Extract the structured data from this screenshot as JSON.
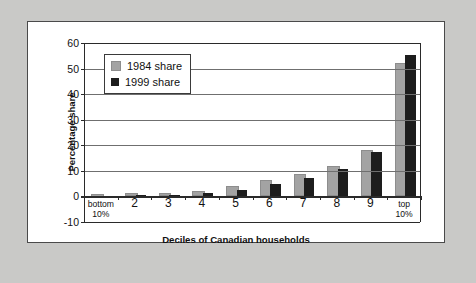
{
  "figure": {
    "background_color": "#c9c9c7",
    "panel_color": "#ffffff",
    "panel_border_color": "#4a4a4a"
  },
  "chart_data": {
    "type": "bar",
    "title": "",
    "subtitle": "",
    "xlabel": "Deciles of Canadian households",
    "ylabel": "Percentage share",
    "categories": [
      "bottom\n10%",
      "2",
      "3",
      "4",
      "5",
      "6",
      "7",
      "8",
      "9",
      "top\n10%"
    ],
    "category_labels": [
      {
        "line1": "bottom",
        "line2": "10%",
        "multiline": true
      },
      {
        "line1": "2",
        "line2": "",
        "multiline": false
      },
      {
        "line1": "3",
        "line2": "",
        "multiline": false
      },
      {
        "line1": "4",
        "line2": "",
        "multiline": false
      },
      {
        "line1": "5",
        "line2": "",
        "multiline": false
      },
      {
        "line1": "6",
        "line2": "",
        "multiline": false
      },
      {
        "line1": "7",
        "line2": "",
        "multiline": false
      },
      {
        "line1": "8",
        "line2": "",
        "multiline": false
      },
      {
        "line1": "9",
        "line2": "",
        "multiline": false
      },
      {
        "line1": "top",
        "line2": "10%",
        "multiline": true
      }
    ],
    "series": [
      {
        "name": "1984 share",
        "color": "#a3a3a3",
        "values": [
          -0.3,
          0.2,
          0.7,
          1.5,
          3.4,
          5.5,
          7.9,
          11.1,
          17.2,
          51.5
        ]
      },
      {
        "name": "1999 share",
        "color": "#1d1d1d",
        "values": [
          -0.4,
          0.1,
          0.3,
          1.2,
          2.7,
          4.7,
          7.3,
          10.7,
          17.3,
          55.5
        ]
      }
    ],
    "ylim": [
      -10,
      60
    ],
    "ytick_values": [
      -10,
      0,
      10,
      20,
      30,
      40,
      50,
      60
    ],
    "ytick_labels": [
      "-10",
      "0",
      "10",
      "20",
      "30",
      "40",
      "50",
      "60"
    ],
    "grid": true,
    "grid_axis": "y",
    "legend_position": "upper left",
    "legend_entries": [
      "1984 share",
      "1999 share"
    ]
  }
}
